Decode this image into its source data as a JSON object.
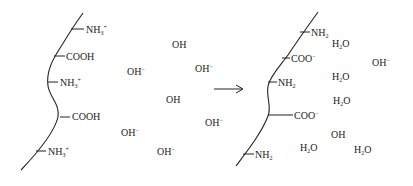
{
  "diagram": {
    "type": "reaction-schematic",
    "arrow": {
      "direction": "right",
      "meaning": "reacts to"
    },
    "left_chain": {
      "groups": [
        {
          "base": "NH",
          "sub": "3",
          "sup": "+",
          "x": 86,
          "y": 25
        },
        {
          "base": "COOH",
          "sub": "",
          "sup": "",
          "x": 66,
          "y": 52
        },
        {
          "base": "NH",
          "sub": "3",
          "sup": "+",
          "x": 60,
          "y": 78
        },
        {
          "base": "COOH",
          "sub": "",
          "sup": "",
          "x": 72,
          "y": 112
        },
        {
          "base": "NH",
          "sub": "3",
          "sup": "+",
          "x": 48,
          "y": 147
        }
      ],
      "ions": [
        {
          "base": "OH",
          "sup": "",
          "x": 172,
          "y": 40
        },
        {
          "base": "OH",
          "sup": "−",
          "x": 127,
          "y": 67
        },
        {
          "base": "OH",
          "sup": "−",
          "x": 195,
          "y": 64
        },
        {
          "base": "OH",
          "sup": "",
          "x": 166,
          "y": 95
        },
        {
          "base": "OH",
          "sup": "−",
          "x": 205,
          "y": 118
        },
        {
          "base": "OH",
          "sup": "−",
          "x": 121,
          "y": 128
        },
        {
          "base": "OH",
          "sup": "−",
          "x": 157,
          "y": 147
        }
      ]
    },
    "right_chain": {
      "groups": [
        {
          "base": "NH",
          "sub": "2",
          "sup": "",
          "x": 311,
          "y": 28
        },
        {
          "base": "COO",
          "sub": "",
          "sup": "−",
          "x": 291,
          "y": 54
        },
        {
          "base": "NH",
          "sub": "2",
          "sup": "",
          "x": 278,
          "y": 78
        },
        {
          "base": "COO",
          "sub": "",
          "sup": "−",
          "x": 294,
          "y": 111
        },
        {
          "base": "NH",
          "sub": "2",
          "sup": "",
          "x": 255,
          "y": 150
        }
      ],
      "molecules": [
        {
          "base": "H",
          "sub": "2",
          "rest": "O",
          "x": 332,
          "y": 39
        },
        {
          "base": "H",
          "sub": "2",
          "rest": "O",
          "x": 332,
          "y": 72
        },
        {
          "base": "H",
          "sub": "2",
          "rest": "O",
          "x": 333,
          "y": 96
        },
        {
          "base": "H",
          "sub": "2",
          "rest": "O",
          "x": 300,
          "y": 143
        },
        {
          "base": "H",
          "sub": "2",
          "rest": "O",
          "x": 354,
          "y": 145
        }
      ],
      "ions": [
        {
          "base": "OH",
          "sup": "−",
          "x": 372,
          "y": 58
        },
        {
          "base": "OH",
          "sup": "",
          "x": 331,
          "y": 130
        }
      ]
    }
  }
}
